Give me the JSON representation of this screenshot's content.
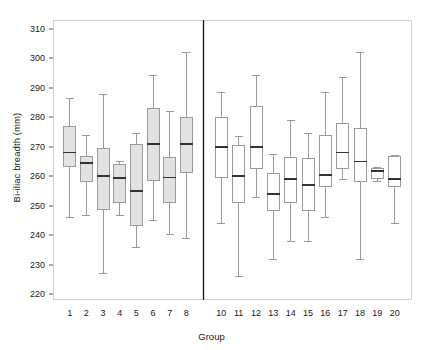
{
  "chart_data": {
    "type": "box",
    "title": "",
    "xlabel": "Group",
    "ylabel": "Bi-iliac breadth (mm)",
    "ylim": [
      218,
      313
    ],
    "yticks": [
      220,
      230,
      240,
      250,
      260,
      270,
      280,
      290,
      300,
      310
    ],
    "ytick_labels": [
      "220",
      "230",
      "240",
      "250",
      "260",
      "270",
      "280",
      "290",
      "300",
      "310"
    ],
    "grid": false,
    "legend": "none",
    "panel_divider_after_category": "8",
    "categories": [
      "1",
      "2",
      "3",
      "4",
      "5",
      "6",
      "7",
      "8",
      "10",
      "11",
      "12",
      "13",
      "14",
      "15",
      "16",
      "17",
      "18",
      "19",
      "20"
    ],
    "panels": [
      {
        "name": "left",
        "fill": "#e2e2e2",
        "categories": [
          "1",
          "2",
          "3",
          "4",
          "5",
          "6",
          "7",
          "8"
        ]
      },
      {
        "name": "right",
        "fill": "#ffffff",
        "categories": [
          "10",
          "11",
          "12",
          "13",
          "14",
          "15",
          "16",
          "17",
          "18",
          "19",
          "20"
        ]
      }
    ],
    "boxes": [
      {
        "group": "1",
        "panel": "left",
        "whisker_low": 246.0,
        "q1": 263.0,
        "median": 268.0,
        "q3": 277.0,
        "whisker_high": 286.5
      },
      {
        "group": "2",
        "panel": "left",
        "whisker_low": 247.0,
        "q1": 258.0,
        "median": 264.5,
        "q3": 267.0,
        "whisker_high": 274.0
      },
      {
        "group": "3",
        "panel": "left",
        "whisker_low": 227.0,
        "q1": 248.5,
        "median": 260.0,
        "q3": 269.5,
        "whisker_high": 288.0
      },
      {
        "group": "4",
        "panel": "left",
        "whisker_low": 247.0,
        "q1": 251.0,
        "median": 259.3,
        "q3": 264.0,
        "whisker_high": 265.0
      },
      {
        "group": "5",
        "panel": "left",
        "whisker_low": 236.0,
        "q1": 243.0,
        "median": 255.0,
        "q3": 271.0,
        "whisker_high": 274.5
      },
      {
        "group": "6",
        "panel": "left",
        "whisker_low": 245.0,
        "q1": 258.5,
        "median": 271.0,
        "q3": 283.3,
        "whisker_high": 294.5
      },
      {
        "group": "7",
        "panel": "left",
        "whisker_low": 240.5,
        "q1": 251.0,
        "median": 259.5,
        "q3": 266.5,
        "whisker_high": 282.0
      },
      {
        "group": "8",
        "panel": "left",
        "whisker_low": 239.0,
        "q1": 261.0,
        "median": 271.0,
        "q3": 280.0,
        "whisker_high": 302.0
      },
      {
        "group": "10",
        "panel": "right",
        "whisker_low": 244.0,
        "q1": 259.5,
        "median": 270.0,
        "q3": 280.0,
        "whisker_high": 288.5
      },
      {
        "group": "11",
        "panel": "right",
        "whisker_low": 226.0,
        "q1": 251.0,
        "median": 260.0,
        "q3": 270.5,
        "whisker_high": 273.5
      },
      {
        "group": "12",
        "panel": "right",
        "whisker_low": 253.0,
        "q1": 262.3,
        "median": 270.0,
        "q3": 283.8,
        "whisker_high": 294.5
      },
      {
        "group": "13",
        "panel": "right",
        "whisker_low": 232.0,
        "q1": 248.3,
        "median": 254.0,
        "q3": 261.0,
        "whisker_high": 267.5
      },
      {
        "group": "14",
        "panel": "right",
        "whisker_low": 238.0,
        "q1": 251.0,
        "median": 259.0,
        "q3": 266.5,
        "whisker_high": 279.0
      },
      {
        "group": "15",
        "panel": "right",
        "whisker_low": 238.0,
        "q1": 248.3,
        "median": 257.0,
        "q3": 266.3,
        "whisker_high": 274.5
      },
      {
        "group": "16",
        "panel": "right",
        "whisker_low": 246.0,
        "q1": 256.3,
        "median": 260.5,
        "q3": 274.0,
        "whisker_high": 288.5
      },
      {
        "group": "17",
        "panel": "right",
        "whisker_low": 259.0,
        "q1": 262.3,
        "median": 268.0,
        "q3": 278.0,
        "whisker_high": 293.5
      },
      {
        "group": "18",
        "panel": "right",
        "whisker_low": 232.0,
        "q1": 258.0,
        "median": 265.0,
        "q3": 276.5,
        "whisker_high": 302.0
      },
      {
        "group": "19",
        "panel": "right",
        "whisker_low": 258.5,
        "q1": 259.0,
        "median": 261.8,
        "q3": 262.8,
        "whisker_high": 263.0
      },
      {
        "group": "20",
        "panel": "right",
        "whisker_low": 244.0,
        "q1": 256.3,
        "median": 259.0,
        "q3": 267.0,
        "whisker_high": 267.2
      }
    ]
  }
}
